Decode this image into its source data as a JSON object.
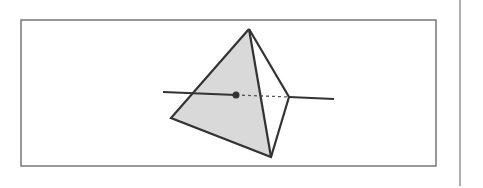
{
  "diagram": {
    "colors": {
      "stroke": "#333333",
      "frame": "#777777",
      "face_fill": "#d9d9d9",
      "background": "#ffffff"
    },
    "frame": {
      "x": 21,
      "y": 20,
      "width": 415,
      "height": 146
    },
    "side_rule": {
      "x": 460,
      "y1": 0,
      "y2": 186
    },
    "tetrahedron": {
      "apex": [
        249,
        29
      ],
      "left": [
        171,
        118
      ],
      "bottom": [
        271,
        157
      ],
      "right": [
        289,
        97
      ]
    },
    "line": {
      "start": [
        163,
        92
      ],
      "entry_point": [
        236,
        95
      ],
      "exit_point": [
        289,
        97
      ],
      "end": [
        334,
        99
      ]
    }
  }
}
